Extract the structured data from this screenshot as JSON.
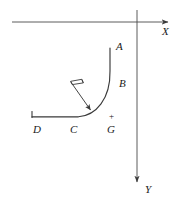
{
  "figure": {
    "type": "physics-diagram",
    "background_color": "#ffffff",
    "stroke_color": "#3a3a3a",
    "label_color": "#1a1a1a",
    "axes": {
      "x": {
        "label": "X",
        "orientation": "horizontal",
        "arrow_direction": "right",
        "start": [
          12,
          22
        ],
        "end": [
          172,
          22
        ],
        "label_pos": [
          163,
          33
        ]
      },
      "y": {
        "label": "Y",
        "orientation": "vertical",
        "arrow_direction": "down",
        "start": [
          137,
          10
        ],
        "end": [
          137,
          186
        ],
        "label_pos": [
          145,
          190
        ]
      }
    },
    "track": {
      "name": "curved-track",
      "points": [
        {
          "label": "A",
          "role": "upper-end-of-vertical-segment",
          "x": 110,
          "y": 48,
          "label_pos": [
            116,
            47
          ]
        },
        {
          "label": "B",
          "role": "point-on-curve",
          "x": 112,
          "y": 84,
          "label_pos": [
            119,
            84
          ]
        },
        {
          "label": "C",
          "role": "base-of-curve-on-horizontal",
          "x": 78,
          "y": 117,
          "label_pos": [
            73,
            131
          ]
        },
        {
          "label": "D",
          "role": "left-end-of-horizontal-segment",
          "x": 32,
          "y": 117,
          "label_pos": [
            35,
            131
          ]
        }
      ],
      "path": "M 110 48 L 110 72 C 110 100 96 115 78 117 L 32 117"
    },
    "markers": [
      {
        "name": "point-G",
        "label": "G",
        "sign": "+",
        "label_pos": [
          110,
          131
        ],
        "sign_pos": [
          111,
          119
        ],
        "description": "charge marker below the curve near the base"
      }
    ],
    "force_arrow": {
      "name": "normal-force-arrow",
      "from": [
        71,
        82
      ],
      "to": [
        92,
        112
      ],
      "arrowhead": "filled",
      "has_right_angle_marker": true,
      "right_angle_marker_pos": [
        75,
        81
      ],
      "description": "arrow pointing down-right onto the curve with a small right-angle (perpendicular) marker at its tail"
    }
  }
}
